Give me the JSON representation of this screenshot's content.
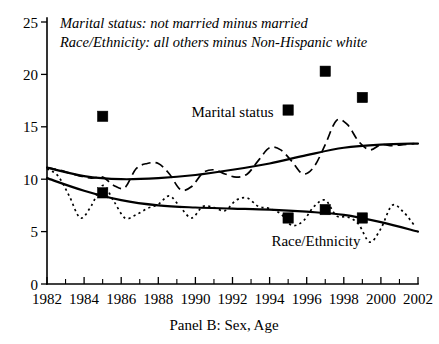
{
  "chart_data": {
    "type": "line",
    "title": "",
    "panel_label": "Panel B: Sex, Age",
    "notes": [
      "Marital status: not married minus married",
      "Race/Ethnicity: all others minus Non-Hispanic white"
    ],
    "xlabel": "",
    "ylabel": "",
    "xlim": [
      1982,
      2002
    ],
    "ylim": [
      0,
      25
    ],
    "yticks": [
      0,
      5,
      10,
      15,
      20,
      25
    ],
    "ytick_labels": [
      "0",
      "5",
      "10",
      "15",
      "20",
      "25"
    ],
    "xticks": [
      1982,
      1984,
      1986,
      1988,
      1990,
      1992,
      1994,
      1996,
      1998,
      2000,
      2002
    ],
    "xtick_labels": [
      "1982",
      "1984",
      "1986",
      "1988",
      "1990",
      "1992",
      "1994",
      "1996",
      "1998",
      "2000",
      "2002"
    ],
    "x_minor_ticks": [
      1983,
      1985,
      1987,
      1989,
      1991,
      1993,
      1995,
      1997,
      1999,
      2001
    ],
    "grid": false,
    "legend_position": "inline-annotations",
    "accent_color": "#000000",
    "background_color": "#ffffff",
    "series": [
      {
        "name": "Marital status",
        "label_text": "Marital status",
        "label_x": 1992.0,
        "label_y": 15.9,
        "style": "dashed",
        "x": [
          1982,
          1982.6,
          1983.2,
          1983.8,
          1984.4,
          1985.0,
          1985.6,
          1986.2,
          1986.8,
          1987.4,
          1988.0,
          1988.6,
          1989.2,
          1989.8,
          1990.4,
          1991.0,
          1991.6,
          1992.2,
          1992.8,
          1993.4,
          1994.0,
          1994.6,
          1995.2,
          1995.8,
          1996.4,
          1997.0,
          1997.6,
          1998.2,
          1998.8,
          1999.4,
          2000.0,
          2000.6,
          2001.2,
          2001.8
        ],
        "values": [
          11.1,
          10.9,
          10.6,
          10.3,
          10.1,
          10.2,
          9.4,
          9.2,
          11.0,
          11.5,
          11.5,
          10.5,
          9.0,
          9.3,
          10.6,
          10.9,
          10.5,
          10.2,
          10.5,
          11.8,
          13.0,
          12.8,
          11.7,
          10.5,
          11.2,
          13.3,
          15.6,
          15.2,
          13.6,
          12.8,
          13.3,
          13.2,
          13.3,
          13.4
        ]
      },
      {
        "name": "Marital status trend",
        "label_text": "",
        "style": "solid-trend",
        "x": [
          1982,
          1984,
          1986,
          1988,
          1990,
          1992,
          1994,
          1996,
          1998,
          2000,
          2002
        ],
        "values": [
          11.1,
          10.3,
          10.0,
          10.1,
          10.4,
          10.9,
          11.5,
          12.3,
          13.0,
          13.3,
          13.4
        ]
      },
      {
        "name": "Race/Ethnicity",
        "label_text": "Race/Ethnicity",
        "label_x": 1996.5,
        "label_y": 3.6,
        "style": "dotted",
        "x": [
          1982,
          1982.6,
          1983.2,
          1983.8,
          1984.4,
          1985.0,
          1985.6,
          1986.2,
          1986.8,
          1987.4,
          1988.0,
          1988.6,
          1989.2,
          1989.8,
          1990.4,
          1991.0,
          1991.6,
          1992.2,
          1992.8,
          1993.4,
          1994.0,
          1994.6,
          1995.2,
          1995.8,
          1996.4,
          1997.0,
          1997.6,
          1998.2,
          1998.8,
          1999.4,
          2000.0,
          2000.6,
          2001.2,
          2001.8
        ],
        "values": [
          11.0,
          10.3,
          8.4,
          6.3,
          7.5,
          9.4,
          7.9,
          6.3,
          6.6,
          7.2,
          7.6,
          8.4,
          7.3,
          6.3,
          7.4,
          7.3,
          7.0,
          8.0,
          8.2,
          7.4,
          7.2,
          6.7,
          5.6,
          6.0,
          7.4,
          8.0,
          6.5,
          6.4,
          5.7,
          4.0,
          5.3,
          7.5,
          6.9,
          5.6
        ]
      },
      {
        "name": "Race/Ethnicity trend",
        "label_text": "",
        "style": "solid-trend",
        "x": [
          1982,
          1984,
          1986,
          1988,
          1990,
          1992,
          1994,
          1996,
          1998,
          2000,
          2002
        ],
        "values": [
          10.1,
          8.9,
          8.0,
          7.5,
          7.3,
          7.2,
          7.1,
          6.9,
          6.6,
          5.9,
          5.0
        ]
      }
    ],
    "markers": [
      {
        "series": "Marital status",
        "x": 1985,
        "y": 16.0
      },
      {
        "series": "Marital status",
        "x": 1995,
        "y": 16.6
      },
      {
        "series": "Marital status",
        "x": 1997,
        "y": 20.3
      },
      {
        "series": "Marital status",
        "x": 1999,
        "y": 17.8
      },
      {
        "series": "Race/Ethnicity",
        "x": 1985,
        "y": 8.7
      },
      {
        "series": "Race/Ethnicity",
        "x": 1995,
        "y": 6.3
      },
      {
        "series": "Race/Ethnicity",
        "x": 1997,
        "y": 7.1
      },
      {
        "series": "Race/Ethnicity",
        "x": 1999,
        "y": 6.3
      }
    ]
  }
}
